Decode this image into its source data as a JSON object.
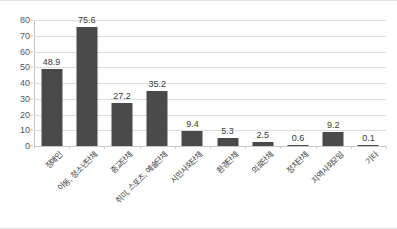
{
  "chart_data": {
    "type": "bar",
    "title": "",
    "xlabel": "",
    "ylabel": "",
    "ylim": [
      0,
      80
    ],
    "ytick_step": 10,
    "yticks": [
      80,
      70,
      60,
      50,
      40,
      30,
      20,
      10,
      0
    ],
    "grid": true,
    "legend": null,
    "bar_color": "#4a4a4a",
    "categories": [
      "장애인",
      "아동, 청소년단체",
      "종교단체",
      "취미, 스포츠, 예술단체",
      "시민사회단체",
      "환경단체",
      "의료단체",
      "정치단체",
      "지역사회모임",
      "기타"
    ],
    "values": [
      48.9,
      75.6,
      27.2,
      35.2,
      9.4,
      5.3,
      2.5,
      0.6,
      9.2,
      0.1
    ],
    "data_labels": [
      "48.9",
      "75.6",
      "27.2",
      "35.2",
      "9.4",
      "5.3",
      "2.5",
      "0.6",
      "9.2",
      "0.1"
    ]
  },
  "chart": {
    "title_text": ""
  }
}
